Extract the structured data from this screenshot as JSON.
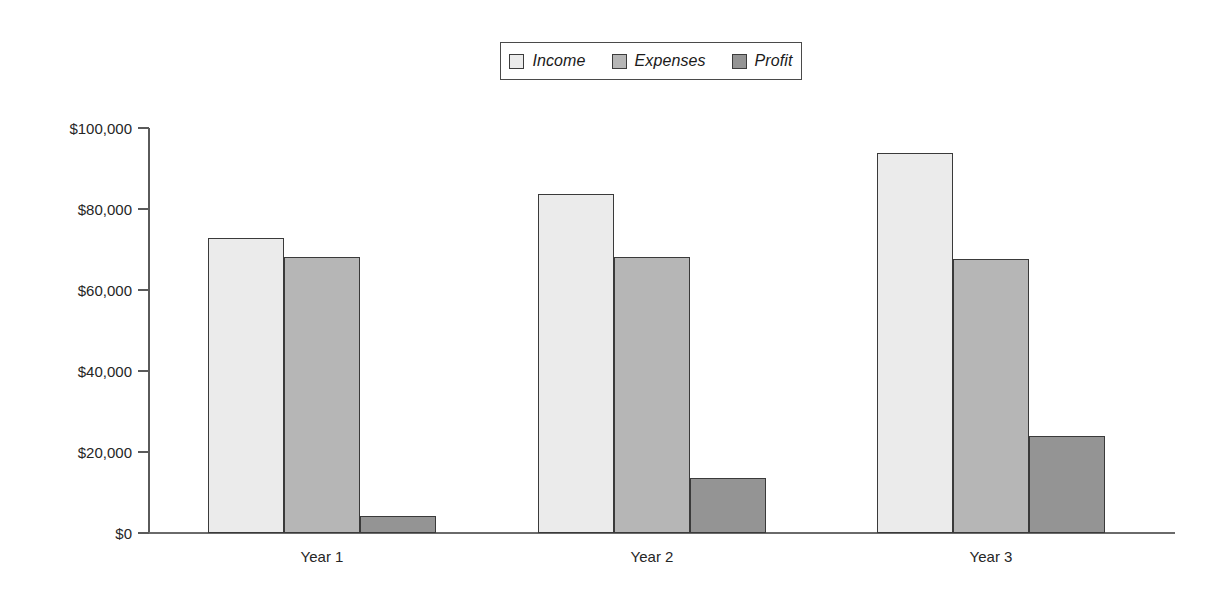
{
  "chart_data": {
    "type": "bar",
    "title": "",
    "subtitle": "",
    "xlabel": "",
    "ylabel": "",
    "categories": [
      "Year 1",
      "Year 2",
      "Year 3"
    ],
    "series": [
      {
        "name": "Income",
        "values": [
          72800,
          83700,
          93800
        ],
        "color": "#ebebeb"
      },
      {
        "name": "Expenses",
        "values": [
          68100,
          68100,
          67700
        ],
        "color": "#b6b6b6"
      },
      {
        "name": "Profit",
        "values": [
          4200,
          13600,
          24000
        ],
        "color": "#949494"
      }
    ],
    "ylim": [
      0,
      100000
    ],
    "yticks": [
      0,
      20000,
      40000,
      60000,
      80000,
      100000
    ],
    "ytick_labels": [
      "$0",
      "$20,000",
      "$40,000",
      "$60,000",
      "$80,000",
      "$100,000"
    ],
    "grid": false,
    "legend_position": "top-center",
    "currency_prefix": "$",
    "bar_border_color": "#3a3a3a",
    "axis_color": "#5a5a5a",
    "background": "#ffffff"
  },
  "legend": {
    "entries": [
      {
        "label": "Income",
        "swatch_color": "#ebebeb"
      },
      {
        "label": "Expenses",
        "swatch_color": "#b6b6b6"
      },
      {
        "label": "Profit",
        "swatch_color": "#949494"
      }
    ]
  },
  "axis": {
    "y_labels": [
      "$100,000",
      "$80,000",
      "$60,000",
      "$40,000",
      "$20,000",
      "$0"
    ],
    "x_labels": [
      "Year 1",
      "Year 2",
      "Year 3"
    ]
  }
}
